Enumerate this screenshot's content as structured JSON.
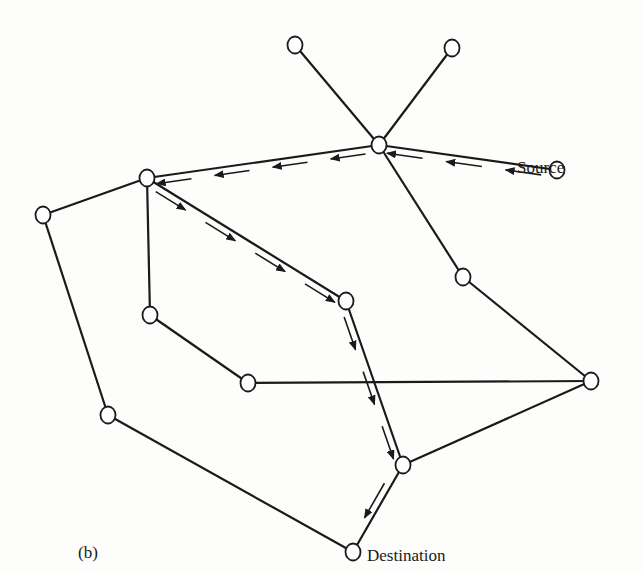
{
  "figure_label": "(b)",
  "labels": {
    "source": "Source",
    "destination": "Destination"
  },
  "colors": {
    "line": "#1a1a1a",
    "node_fill": "#ffffff",
    "background": "#fdfdfc"
  },
  "nodes": [
    {
      "id": "n1",
      "x": 295,
      "y": 45
    },
    {
      "id": "n2",
      "x": 452,
      "y": 48
    },
    {
      "id": "hub",
      "x": 379,
      "y": 145
    },
    {
      "id": "source",
      "x": 557,
      "y": 170
    },
    {
      "id": "left_hub",
      "x": 147,
      "y": 178
    },
    {
      "id": "far_left",
      "x": 43,
      "y": 215
    },
    {
      "id": "right_mid",
      "x": 463,
      "y": 277
    },
    {
      "id": "center",
      "x": 346,
      "y": 301
    },
    {
      "id": "inner_left",
      "x": 150,
      "y": 315
    },
    {
      "id": "lower_mid",
      "x": 248,
      "y": 383
    },
    {
      "id": "far_right",
      "x": 591,
      "y": 381
    },
    {
      "id": "lower_left",
      "x": 108,
      "y": 415
    },
    {
      "id": "pre_dest",
      "x": 403,
      "y": 465
    },
    {
      "id": "destination",
      "x": 353,
      "y": 552
    }
  ],
  "edges": [
    [
      "n1",
      "hub"
    ],
    [
      "n2",
      "hub"
    ],
    [
      "hub",
      "source"
    ],
    [
      "hub",
      "left_hub"
    ],
    [
      "hub",
      "right_mid"
    ],
    [
      "left_hub",
      "far_left"
    ],
    [
      "left_hub",
      "inner_left"
    ],
    [
      "left_hub",
      "center"
    ],
    [
      "far_left",
      "lower_left"
    ],
    [
      "inner_left",
      "lower_mid"
    ],
    [
      "lower_mid",
      "far_right"
    ],
    [
      "right_mid",
      "far_right"
    ],
    [
      "center",
      "pre_dest"
    ],
    [
      "far_right",
      "pre_dest"
    ],
    [
      "lower_left",
      "destination"
    ],
    [
      "pre_dest",
      "destination"
    ]
  ],
  "flow_path": [
    "source",
    "hub",
    "left_hub",
    "center",
    "pre_dest",
    "destination"
  ]
}
